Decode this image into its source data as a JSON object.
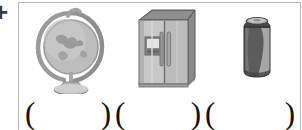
{
  "worksheet": {
    "border_color": "#b9bcbd",
    "background_color": "#ffffff",
    "left_edge_artifact": "+",
    "pictures": [
      {
        "icon": "globe-icon",
        "label": "globe",
        "caption": "",
        "fill_primary": "#b4b4b4",
        "fill_shadow": "#8d8d8d",
        "fill_highlight": "#d7d7d7",
        "outline": "#6e6e6e"
      },
      {
        "icon": "refrigerator-icon",
        "label": "refrigerator",
        "caption": "",
        "fill_primary": "#bcbcbc",
        "fill_shadow": "#8a8a8a",
        "fill_highlight": "#d4d4d4",
        "outline": "#5f5f5f"
      },
      {
        "icon": "soda-can-icon",
        "label": "can",
        "caption": "",
        "fill_primary": "#585858",
        "fill_shadow": "#3b3b3b",
        "fill_highlight": "#bdbdbd",
        "outline": "#2f2f2f"
      }
    ],
    "answer_blanks": [
      {
        "open": "(",
        "close": ")",
        "value": ""
      },
      {
        "open": "(",
        "close": ")",
        "value": ""
      },
      {
        "open": "(",
        "close": ")",
        "value": ""
      }
    ]
  }
}
